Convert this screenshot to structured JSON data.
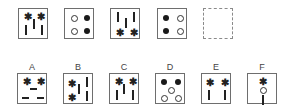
{
  "puzzle": {
    "sequence": [
      {
        "id": "q1",
        "elements": [
          {
            "type": "star",
            "x": 5,
            "y": 4
          },
          {
            "type": "star",
            "x": 18,
            "y": 4
          },
          {
            "type": "bar-v",
            "x": 14,
            "y": 10
          },
          {
            "type": "bar-v",
            "x": 6,
            "y": 16
          },
          {
            "type": "bar-v",
            "x": 22,
            "y": 16
          }
        ]
      },
      {
        "id": "q2",
        "elements": [
          {
            "type": "dot-o",
            "x": 6,
            "y": 6
          },
          {
            "type": "dot-f",
            "x": 19,
            "y": 6
          },
          {
            "type": "dot-o",
            "x": 6,
            "y": 19
          },
          {
            "type": "dot-f",
            "x": 19,
            "y": 19
          }
        ]
      },
      {
        "id": "q3",
        "elements": [
          {
            "type": "bar-v",
            "x": 6,
            "y": 3
          },
          {
            "type": "bar-v",
            "x": 22,
            "y": 3
          },
          {
            "type": "bar-v",
            "x": 14,
            "y": 9
          },
          {
            "type": "star",
            "x": 5,
            "y": 20
          },
          {
            "type": "star",
            "x": 19,
            "y": 20
          }
        ]
      },
      {
        "id": "q4",
        "elements": [
          {
            "type": "dot-f",
            "x": 5,
            "y": 6
          },
          {
            "type": "dot-o",
            "x": 19,
            "y": 6
          },
          {
            "type": "dot-f",
            "x": 5,
            "y": 19
          },
          {
            "type": "dot-o",
            "x": 19,
            "y": 19
          }
        ]
      },
      {
        "id": "q5",
        "missing": true,
        "elements": []
      }
    ],
    "options": [
      {
        "label": "A",
        "elements": [
          {
            "type": "star",
            "x": 5,
            "y": 4
          },
          {
            "type": "star",
            "x": 19,
            "y": 4
          },
          {
            "type": "bar-h",
            "x": 12,
            "y": 14
          },
          {
            "type": "bar-h",
            "x": 4,
            "y": 23
          },
          {
            "type": "bar-h",
            "x": 19,
            "y": 23
          }
        ]
      },
      {
        "label": "B",
        "elements": [
          {
            "type": "star",
            "x": 4,
            "y": 6
          },
          {
            "type": "bar-v",
            "x": 22,
            "y": 3
          },
          {
            "type": "bar-v",
            "x": 14,
            "y": 10
          },
          {
            "type": "star",
            "x": 4,
            "y": 20
          },
          {
            "type": "bar-v",
            "x": 22,
            "y": 17
          }
        ]
      },
      {
        "label": "C",
        "elements": [
          {
            "type": "star",
            "x": 5,
            "y": 4
          },
          {
            "type": "star",
            "x": 19,
            "y": 4
          },
          {
            "type": "bar-v",
            "x": 13,
            "y": 10
          },
          {
            "type": "bar-v",
            "x": 6,
            "y": 16
          },
          {
            "type": "bar-v",
            "x": 22,
            "y": 16
          }
        ]
      },
      {
        "label": "D",
        "elements": [
          {
            "type": "dot-f",
            "x": 5,
            "y": 5
          },
          {
            "type": "dot-f",
            "x": 19,
            "y": 5
          },
          {
            "type": "dot-o",
            "x": 12,
            "y": 13
          },
          {
            "type": "dot-o",
            "x": 5,
            "y": 21
          },
          {
            "type": "dot-o",
            "x": 19,
            "y": 21
          }
        ]
      },
      {
        "label": "E",
        "elements": [
          {
            "type": "star",
            "x": 4,
            "y": 5
          },
          {
            "type": "star",
            "x": 19,
            "y": 5
          },
          {
            "type": "bar-v",
            "x": 6,
            "y": 16
          },
          {
            "type": "bar-v",
            "x": 22,
            "y": 16
          }
        ]
      },
      {
        "label": "F",
        "elements": [
          {
            "type": "star",
            "x": 11,
            "y": 4
          },
          {
            "type": "dot-o",
            "x": 12,
            "y": 13
          },
          {
            "type": "bar-v",
            "x": 14,
            "y": 21
          }
        ]
      }
    ],
    "star_glyph": "✱"
  }
}
